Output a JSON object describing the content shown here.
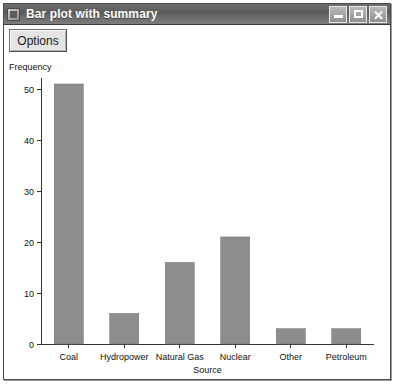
{
  "window": {
    "title": "Bar plot with summary",
    "app_icon": "application-icon",
    "buttons": {
      "minimize": "minimize-button",
      "maximize": "maximize-button",
      "close": "close-button"
    }
  },
  "toolbar": {
    "options_label": "Options"
  },
  "colors": {
    "titlebar": "#5a5a5a",
    "title_text": "#ffffff",
    "bar_fill": "#8d8d8d",
    "bar_stroke": "#6f6f6f",
    "axis": "#333333",
    "plot_background": "#ffffff"
  },
  "chart_data": {
    "type": "bar",
    "title": "",
    "xlabel": "Source",
    "ylabel": "Frequency",
    "categories": [
      "Coal",
      "Hydropower",
      "Natural Gas",
      "Nuclear",
      "Other",
      "Petroleum"
    ],
    "values": [
      51,
      6,
      16,
      21,
      3,
      3
    ],
    "ylim": [
      0,
      51
    ],
    "yticks": [
      0,
      10,
      20,
      30,
      40,
      50
    ],
    "ytick_labels": [
      "0",
      "10",
      "20",
      "30",
      "40",
      "50"
    ],
    "grid": false,
    "legend": false
  }
}
